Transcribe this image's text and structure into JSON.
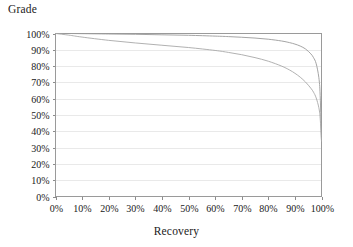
{
  "chart_data": {
    "type": "line",
    "title": "",
    "xlabel": "Recovery",
    "ylabel": "Grade",
    "xlim": [
      0,
      100
    ],
    "ylim": [
      0,
      100
    ],
    "grid": true,
    "legend": false,
    "x_tick_labels": [
      "0%",
      "10%",
      "20%",
      "30%",
      "40%",
      "50%",
      "60%",
      "70%",
      "80%",
      "90%",
      "100%"
    ],
    "x_tick_values": [
      0,
      10,
      20,
      30,
      40,
      50,
      60,
      70,
      80,
      90,
      100
    ],
    "y_tick_labels": [
      "0%",
      "10%",
      "20%",
      "30%",
      "40%",
      "50%",
      "60%",
      "70%",
      "80%",
      "90%",
      "100%"
    ],
    "y_tick_values": [
      0,
      10,
      20,
      30,
      40,
      50,
      60,
      70,
      80,
      90,
      100
    ],
    "x": [
      0,
      5,
      10,
      20,
      30,
      40,
      50,
      60,
      65,
      70,
      75,
      80,
      85,
      88,
      90,
      92,
      94,
      96,
      97,
      98,
      99,
      99.5,
      100
    ],
    "series": [
      {
        "name": "upper-grade-recovery-curve",
        "color": "#9a9a9a",
        "values": [
          100,
          100,
          99.9,
          99.7,
          99.5,
          99.2,
          98.9,
          98.4,
          98.1,
          97.7,
          97.2,
          96.5,
          95.4,
          94.4,
          93.5,
          92.3,
          90.5,
          87.5,
          85.2,
          81.5,
          73.0,
          62.0,
          34.0
        ]
      },
      {
        "name": "lower-grade-recovery-curve",
        "color": "#a8a8a8",
        "values": [
          100,
          99.0,
          97.8,
          95.8,
          94.2,
          92.8,
          91.4,
          89.6,
          88.4,
          87.0,
          85.2,
          83.0,
          80.0,
          77.6,
          75.6,
          73.2,
          70.2,
          66.4,
          64.0,
          60.5,
          54.5,
          48.0,
          34.0
        ]
      }
    ],
    "convergence_point": {
      "x": 100,
      "y": 34
    }
  },
  "axis_titles": {
    "y": "Grade",
    "x": "Recovery"
  }
}
